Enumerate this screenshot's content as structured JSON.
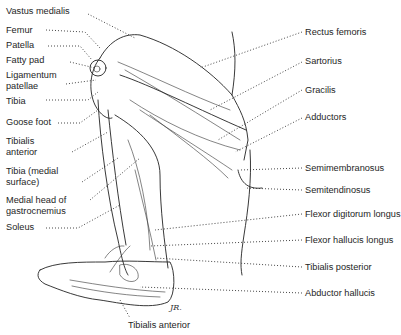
{
  "figure": {
    "signature": "JR."
  },
  "labels_left": [
    {
      "id": "vastus-medialis",
      "text": "Vastus medialis"
    },
    {
      "id": "femur",
      "text": "Femur"
    },
    {
      "id": "patella",
      "text": "Patella"
    },
    {
      "id": "fatty-pad",
      "text": "Fatty pad"
    },
    {
      "id": "ligamentum-patellae",
      "text": "Ligamentum patellae"
    },
    {
      "id": "tibia",
      "text": "Tibia"
    },
    {
      "id": "goose-foot",
      "text": "Goose foot"
    },
    {
      "id": "tibialis-anterior",
      "text": "Tibialis anterior"
    },
    {
      "id": "tibia-medial-surface",
      "text": "Tibia (medial surface)"
    },
    {
      "id": "medial-head-gastrocnemius",
      "text": "Medial head of gastrocnemius"
    },
    {
      "id": "soleus",
      "text": "Soleus"
    }
  ],
  "labels_right": [
    {
      "id": "rectus-femoris",
      "text": "Rectus femoris"
    },
    {
      "id": "sartorius",
      "text": "Sartorius"
    },
    {
      "id": "gracilis",
      "text": "Gracilis"
    },
    {
      "id": "adductors",
      "text": "Adductors"
    },
    {
      "id": "semimembranosus",
      "text": "Semimembranosus"
    },
    {
      "id": "semitendinosus",
      "text": "Semitendinosus"
    },
    {
      "id": "flexor-digitorum-longus",
      "text": "Flexor digitorum longus"
    },
    {
      "id": "flexor-hallucis-longus",
      "text": "Flexor hallucis longus"
    },
    {
      "id": "tibialis-posterior",
      "text": "Tibialis posterior"
    },
    {
      "id": "abductor-hallucis",
      "text": "Abductor hallucis"
    }
  ],
  "labels_bottom": [
    {
      "id": "tibialis-anterior-bottom",
      "text": "Tibialis anterior"
    }
  ]
}
